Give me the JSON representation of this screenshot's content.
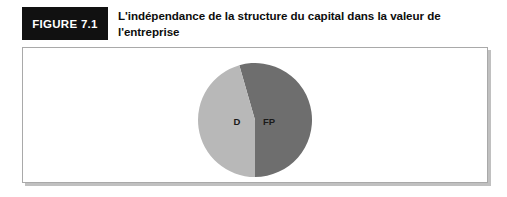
{
  "figure": {
    "tag_label": "FIGURE 7.1",
    "title": "L'indépendance de la structure du capital dans la valeur de l'entreprise",
    "tag_background": "#111111",
    "tag_text_color": "#ffffff",
    "frame_border_color": "#a9a9a9"
  },
  "chart_data": {
    "type": "pie",
    "title": "",
    "categories": [
      "FP",
      "D"
    ],
    "values": [
      54.5,
      45.5
    ],
    "labels": [
      "FP",
      "D"
    ],
    "colors": [
      "#6e6e6e",
      "#b8b8b8"
    ],
    "start_angle_deg": 344,
    "legend": "none",
    "grid": false,
    "slices": [
      {
        "label": "FP",
        "value": 54.5,
        "color": "#6e6e6e",
        "start_angle_deg": 344,
        "end_angle_deg": 180,
        "label_x": 72,
        "label_y": 60
      },
      {
        "label": "D",
        "value": 45.5,
        "color": "#b8b8b8",
        "start_angle_deg": 180,
        "end_angle_deg": 344,
        "label_x": 40,
        "label_y": 60
      }
    ]
  }
}
